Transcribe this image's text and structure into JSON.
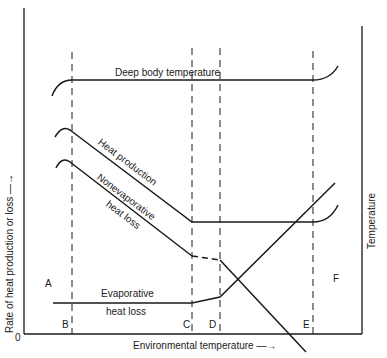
{
  "figure": {
    "y_axis_left_label": "Rate of heat production or loss —→",
    "y_axis_right_label": "Temperature",
    "x_axis_label": "Environmental temperature —→",
    "origin_label": "0",
    "zone_labels": {
      "A": "A",
      "B": "B",
      "C": "C",
      "D": "D",
      "E": "E",
      "F": "F"
    },
    "curves": {
      "deep_body": "Deep body temperature",
      "heat_production": "Heat production",
      "nonevap_1": "Nonevaporative",
      "nonevap_2": "heat loss",
      "evap_1": "Evaporative",
      "evap_2": "heat loss"
    }
  }
}
